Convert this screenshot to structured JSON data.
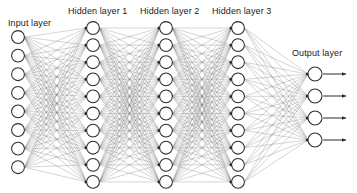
{
  "diagram": {
    "type": "feedforward-neural-network",
    "background_color": "#ffffff",
    "node_fill_color": "#ffffff",
    "node_stroke_color": "#2b2b2b",
    "edge_color": "#7a7a7a",
    "label_color": "#1a1a1a",
    "labels": {
      "input": "Input layer",
      "hidden1": "Hidden layer 1",
      "hidden2": "Hidden layer 2",
      "hidden3": "Hidden layer 3",
      "output": "Output layer"
    },
    "label_positions": [
      {
        "key": "input",
        "x": 8,
        "y": 18
      },
      {
        "key": "hidden1",
        "x": 68,
        "y": 6
      },
      {
        "key": "hidden2",
        "x": 140,
        "y": 6
      },
      {
        "key": "hidden3",
        "x": 212,
        "y": 6
      },
      {
        "key": "output",
        "x": 292,
        "y": 48
      }
    ],
    "layers": [
      {
        "name": "input-layer",
        "label_key": "input",
        "node_count": 8,
        "cx": 18,
        "y_start": 37,
        "y_step": 18.6,
        "radius": 6.4
      },
      {
        "name": "hidden-layer-1",
        "label_key": "hidden1",
        "node_count": 10,
        "cx": 93,
        "y_start": 28,
        "y_step": 17.1,
        "radius": 6.4
      },
      {
        "name": "hidden-layer-2",
        "label_key": "hidden2",
        "node_count": 10,
        "cx": 166,
        "y_start": 28,
        "y_step": 17.1,
        "radius": 6.4
      },
      {
        "name": "hidden-layer-3",
        "label_key": "hidden3",
        "node_count": 10,
        "cx": 238,
        "y_start": 28,
        "y_step": 17.1,
        "radius": 6.4
      },
      {
        "name": "output-layer",
        "label_key": "output",
        "node_count": 4,
        "cx": 315,
        "y_start": 74,
        "y_step": 22.0,
        "radius": 7.0
      }
    ],
    "output_arrows": {
      "count": 4,
      "start_offset": 8,
      "end_x": 351,
      "head_size": 3.4
    }
  }
}
